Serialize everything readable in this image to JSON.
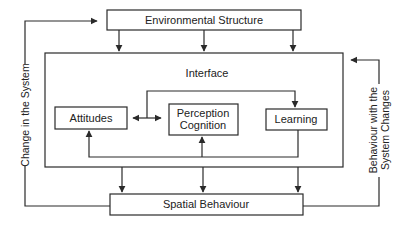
{
  "diagram": {
    "nodes": {
      "environmental_structure": {
        "label": "Environmental Structure"
      },
      "interface": {
        "label": "Interface"
      },
      "attitudes": {
        "label": "Attitudes"
      },
      "perception_cognition": {
        "line1": "Perception",
        "line2": "Cognition"
      },
      "learning": {
        "label": "Learning"
      },
      "spatial_behaviour": {
        "label": "Spatial Behaviour"
      }
    },
    "feedback_labels": {
      "left": "Change in the System",
      "right_line1": "Behaviour with the",
      "right_line2": "System Changes"
    },
    "edges": [
      {
        "from": "environmental_structure",
        "to": "interface",
        "count": 3
      },
      {
        "from": "interface",
        "to": "spatial_behaviour",
        "count": 3
      },
      {
        "from": "spatial_behaviour",
        "to": "environmental_structure",
        "label": "Change in the System"
      },
      {
        "from": "spatial_behaviour",
        "to": "interface",
        "label": "Behaviour with the System Changes"
      },
      {
        "from": "attitudes",
        "to": "perception_cognition",
        "bidirectional": true
      },
      {
        "from": "attitudes/perception_cognition",
        "to": "learning"
      },
      {
        "from": "learning",
        "to": "attitudes"
      },
      {
        "from": "learning",
        "to": "perception_cognition"
      }
    ],
    "colors": {
      "stroke": "#2a2a2a",
      "text": "#222222",
      "background": "#ffffff"
    }
  }
}
